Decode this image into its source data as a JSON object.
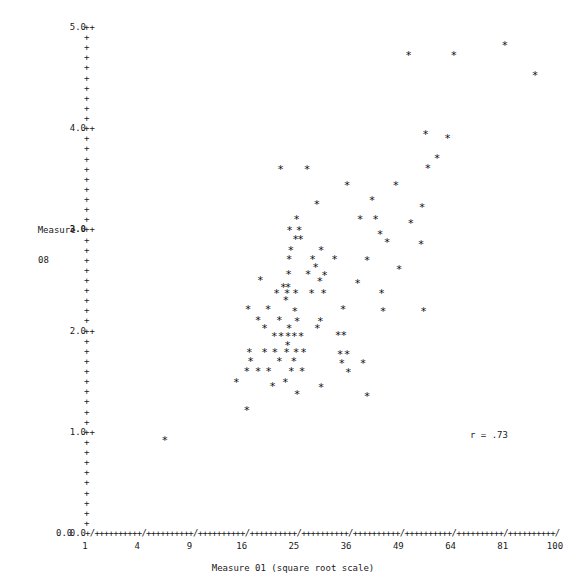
{
  "chart_data": {
    "type": "scatter",
    "title": "",
    "xlabel": "Measure 01 (square root scale)",
    "ylabel_line1": "Measure",
    "ylabel_line2": "08",
    "annotation": "r = .73",
    "correlation": 0.73,
    "x_scale": "square root",
    "y_scale": "linear",
    "grid": false,
    "legend": null,
    "xlim": [
      1,
      100
    ],
    "ylim": [
      0.0,
      5.0
    ],
    "x_tick_labels": [
      "1",
      "4",
      "9",
      "16",
      "25",
      "36",
      "49",
      "64",
      "81",
      "100"
    ],
    "x_tick_values": [
      1,
      4,
      9,
      16,
      25,
      36,
      49,
      64,
      81,
      100
    ],
    "y_tick_labels": [
      "0.0",
      "1.0",
      "2.0",
      "3.0",
      "4.0",
      "5.0"
    ],
    "y_tick_values": [
      0.0,
      1.0,
      2.0,
      3.0,
      4.0,
      5.0
    ],
    "y_minor_tick_count_between": 9,
    "axis_tick_glyph": "+",
    "axis_major_glyph": "/",
    "point_glyph": "*",
    "point_count": 99,
    "points": [
      [
        51.8,
        4.75
      ],
      [
        65.0,
        4.75
      ],
      [
        81.7,
        4.85
      ],
      [
        92.5,
        4.55
      ],
      [
        56.6,
        3.97
      ],
      [
        63.1,
        3.93
      ],
      [
        59.9,
        3.73
      ],
      [
        57.2,
        3.63
      ],
      [
        22.5,
        3.62
      ],
      [
        27.6,
        3.62
      ],
      [
        36.2,
        3.46
      ],
      [
        48.3,
        3.46
      ],
      [
        42.2,
        3.32
      ],
      [
        29.6,
        3.28
      ],
      [
        55.6,
        3.25
      ],
      [
        25.5,
        3.13
      ],
      [
        39.3,
        3.13
      ],
      [
        43.1,
        3.13
      ],
      [
        52.4,
        3.09
      ],
      [
        24.2,
        3.02
      ],
      [
        26.0,
        3.02
      ],
      [
        44.2,
        2.98
      ],
      [
        25.3,
        2.93
      ],
      [
        26.3,
        2.93
      ],
      [
        46.0,
        2.9
      ],
      [
        55.3,
        2.88
      ],
      [
        24.4,
        2.82
      ],
      [
        30.5,
        2.82
      ],
      [
        24.1,
        2.73
      ],
      [
        28.7,
        2.73
      ],
      [
        33.4,
        2.73
      ],
      [
        41.0,
        2.72
      ],
      [
        29.3,
        2.65
      ],
      [
        49.2,
        2.63
      ],
      [
        24.0,
        2.58
      ],
      [
        27.8,
        2.58
      ],
      [
        31.2,
        2.57
      ],
      [
        19.0,
        2.52
      ],
      [
        30.2,
        2.51
      ],
      [
        38.7,
        2.5
      ],
      [
        23.0,
        2.46
      ],
      [
        23.9,
        2.46
      ],
      [
        21.8,
        2.4
      ],
      [
        23.7,
        2.4
      ],
      [
        25.3,
        2.4
      ],
      [
        28.5,
        2.4
      ],
      [
        31.0,
        2.4
      ],
      [
        44.6,
        2.4
      ],
      [
        23.5,
        2.33
      ],
      [
        17.0,
        2.24
      ],
      [
        20.3,
        2.24
      ],
      [
        25.2,
        2.22
      ],
      [
        35.3,
        2.24
      ],
      [
        45.0,
        2.22
      ],
      [
        56.0,
        2.22
      ],
      [
        18.6,
        2.13
      ],
      [
        22.3,
        2.13
      ],
      [
        25.6,
        2.12
      ],
      [
        30.3,
        2.12
      ],
      [
        19.7,
        2.05
      ],
      [
        24.1,
        2.05
      ],
      [
        29.7,
        2.05
      ],
      [
        21.4,
        1.97
      ],
      [
        22.6,
        1.97
      ],
      [
        23.9,
        1.97
      ],
      [
        25.1,
        1.97
      ],
      [
        26.4,
        1.97
      ],
      [
        34.2,
        1.98
      ],
      [
        35.5,
        1.98
      ],
      [
        23.8,
        1.88
      ],
      [
        17.2,
        1.81
      ],
      [
        19.7,
        1.81
      ],
      [
        21.5,
        1.81
      ],
      [
        23.6,
        1.81
      ],
      [
        25.4,
        1.81
      ],
      [
        26.9,
        1.81
      ],
      [
        34.6,
        1.79
      ],
      [
        36.2,
        1.79
      ],
      [
        17.4,
        1.72
      ],
      [
        22.3,
        1.72
      ],
      [
        25.0,
        1.72
      ],
      [
        35.0,
        1.7
      ],
      [
        40.0,
        1.7
      ],
      [
        16.8,
        1.63
      ],
      [
        18.6,
        1.63
      ],
      [
        20.4,
        1.63
      ],
      [
        24.5,
        1.63
      ],
      [
        26.6,
        1.63
      ],
      [
        36.5,
        1.62
      ],
      [
        15.2,
        1.52
      ],
      [
        23.4,
        1.52
      ],
      [
        21.1,
        1.48
      ],
      [
        30.5,
        1.47
      ],
      [
        25.6,
        1.4
      ],
      [
        41.0,
        1.38
      ],
      [
        16.8,
        1.24
      ],
      [
        6.4,
        0.94
      ]
    ]
  },
  "axis": {
    "y_title_line1": "Measure",
    "y_title_line2": "08",
    "x_title": "Measure 01 (square root scale)"
  },
  "annotation": {
    "correlation_text": "r = .73"
  },
  "colors": {
    "background": "#ffffff",
    "foreground": "#1a1a1a",
    "point": "#111111"
  }
}
